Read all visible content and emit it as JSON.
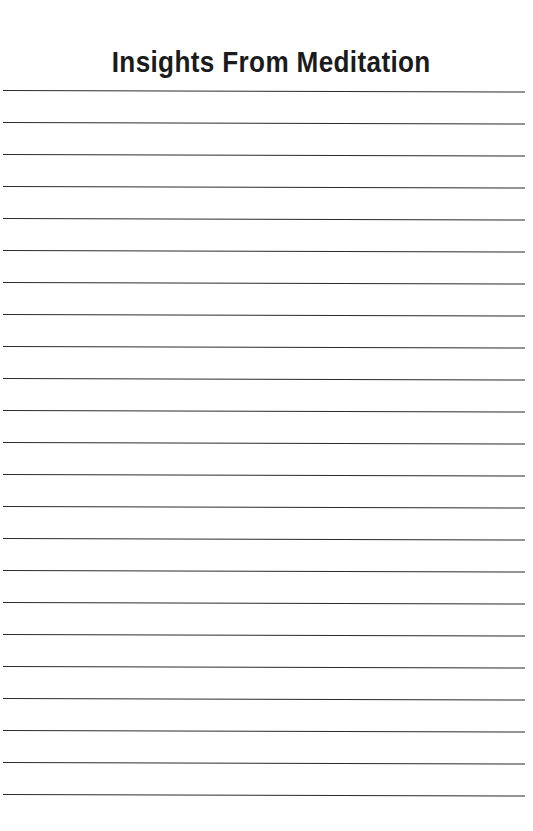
{
  "document": {
    "type": "lined-notebook-page",
    "title": "Insights From Meditation",
    "background_color": "#ffffff",
    "title_color": "#1b1b1b",
    "rule_color": "#2b2b2e"
  },
  "rules": {
    "count": 23,
    "first_line_y": 90,
    "spacing_px": 32,
    "left_x": 3,
    "right_x": 525,
    "thickness_px": 1.6,
    "line_numbers": [
      1,
      2,
      3,
      4,
      5,
      6,
      7,
      8,
      9,
      10,
      11,
      12,
      13,
      14,
      15,
      16,
      17,
      18,
      19,
      20,
      21,
      22,
      23
    ]
  }
}
